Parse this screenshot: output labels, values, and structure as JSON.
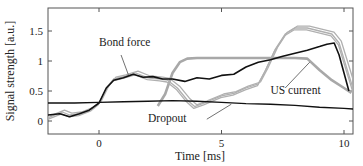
{
  "chart_data": {
    "type": "line",
    "title": "",
    "xlabel": "Time [ms]",
    "ylabel": "Signal strength [a.u.]",
    "xlim": [
      -2.1,
      10.4
    ],
    "ylim": [
      -0.22,
      1.88
    ],
    "x_ticks": [
      0,
      5,
      10
    ],
    "x_tick_labels": [
      "0",
      "5",
      "10"
    ],
    "y_ticks": [
      0,
      0.5,
      1,
      1.5
    ],
    "y_tick_labels": [
      "0",
      "0.5",
      "1",
      "1.5"
    ],
    "grid": false,
    "legend": "none (inline annotations)",
    "annotations": [
      {
        "text": "Bond force",
        "x": 0.0,
        "y": 1.25
      },
      {
        "text": "US current",
        "x": 7.0,
        "y": 0.45
      },
      {
        "text": "Dropout",
        "x": 2.0,
        "y": -0.02
      }
    ],
    "series": [
      {
        "name": "US current",
        "color": "#a8a8a8",
        "x": [
          2.4,
          2.7,
          3.0,
          3.3,
          3.6,
          4.0,
          5.0,
          6.0,
          7.0,
          8.0,
          8.5,
          9.0,
          9.5,
          10.0,
          10.3
        ],
        "values": [
          0.25,
          0.45,
          0.8,
          0.98,
          1.04,
          1.05,
          1.05,
          1.05,
          1.05,
          1.05,
          1.04,
          0.85,
          0.68,
          0.55,
          0.47
        ]
      },
      {
        "name": "Bond force (repetitions, gray)",
        "color": "#b0b0b0",
        "x": [
          -2.1,
          -1.5,
          -1.2,
          -0.8,
          -0.3,
          0.0,
          0.3,
          0.6,
          1.0,
          1.5,
          2.0,
          2.5,
          2.8,
          3.2,
          3.6,
          3.9,
          4.3,
          5.0,
          5.5,
          6.0,
          6.5,
          6.8,
          7.2,
          7.6,
          8.0,
          8.5,
          9.0,
          9.5,
          9.8,
          10.1,
          10.4
        ],
        "values": [
          0.05,
          0.15,
          0.1,
          0.12,
          0.2,
          0.3,
          0.55,
          0.7,
          0.74,
          0.8,
          0.72,
          0.7,
          0.68,
          0.55,
          0.35,
          0.24,
          0.3,
          0.42,
          0.46,
          0.55,
          0.62,
          0.85,
          1.2,
          1.45,
          1.55,
          1.55,
          1.5,
          1.45,
          1.3,
          0.9,
          0.5
        ]
      },
      {
        "name": "Bond force",
        "color": "#111111",
        "x": [
          -2.1,
          -1.6,
          -1.2,
          -0.8,
          -0.4,
          0.0,
          0.3,
          0.6,
          1.0,
          1.4,
          1.8,
          2.2,
          2.6,
          3.0,
          3.5,
          4.0,
          4.5,
          5.0,
          5.5,
          6.0,
          6.5,
          7.0,
          7.5,
          8.0,
          8.5,
          9.0,
          9.3,
          9.6,
          9.8,
          10.0,
          10.2
        ],
        "values": [
          0.1,
          0.12,
          0.07,
          0.12,
          0.18,
          0.3,
          0.55,
          0.68,
          0.72,
          0.78,
          0.73,
          0.74,
          0.7,
          0.7,
          0.66,
          0.72,
          0.7,
          0.76,
          0.78,
          0.9,
          0.98,
          1.02,
          1.08,
          1.13,
          1.18,
          1.24,
          1.28,
          1.3,
          1.1,
          0.8,
          0.5
        ]
      },
      {
        "name": "Dropout",
        "color": "#111111",
        "x": [
          -2.1,
          -1.0,
          0.0,
          1.0,
          2.0,
          3.0,
          4.0,
          5.0,
          6.0,
          7.0,
          8.0,
          9.0,
          10.0,
          10.4
        ],
        "values": [
          0.3,
          0.3,
          0.31,
          0.32,
          0.33,
          0.34,
          0.33,
          0.31,
          0.29,
          0.28,
          0.26,
          0.23,
          0.21,
          0.2
        ]
      }
    ]
  }
}
